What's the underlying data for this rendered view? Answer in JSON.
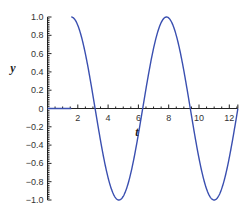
{
  "chart_data": {
    "type": "line",
    "title": "",
    "xlabel": "t",
    "ylabel": "y",
    "xlim": [
      0,
      12.566
    ],
    "ylim": [
      -1.0,
      1.0
    ],
    "x_ticks": [
      2,
      4,
      6,
      8,
      10,
      12
    ],
    "x_tick_labels": [
      "2",
      "4",
      "6",
      "8",
      "10",
      "12"
    ],
    "y_ticks": [
      1.0,
      0.8,
      0.6,
      0.4,
      0.2,
      0,
      -0.2,
      -0.4,
      -0.6,
      -0.8,
      -1.0
    ],
    "y_tick_labels": [
      "1.0",
      "0.8",
      "0.6",
      "0.4",
      "0.2",
      "0",
      "−0.2",
      "−0.4",
      "−0.6",
      "−0.8",
      "−1.0"
    ],
    "grid": false,
    "legend": null,
    "series": [
      {
        "name": "y(t)",
        "description": "y = 0 for t < pi/2; y = sin(t) for t >= pi/2",
        "color": "#3a4fb0",
        "x": [
          0,
          1.571,
          1.571,
          2.356,
          3.142,
          3.927,
          4.712,
          5.498,
          6.283,
          7.069,
          7.854,
          8.639,
          9.425,
          10.21,
          10.996,
          11.781,
          12.566
        ],
        "values": [
          0,
          0,
          1.0,
          0.707,
          0,
          -0.707,
          -1.0,
          -0.707,
          0,
          0.707,
          1.0,
          0.707,
          0,
          -0.707,
          -1.0,
          -0.707,
          0
        ]
      }
    ]
  }
}
